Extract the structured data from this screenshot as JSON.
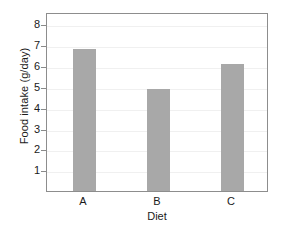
{
  "chart_data": {
    "type": "bar",
    "title": "",
    "subtitle": "",
    "xlabel": "Diet",
    "ylabel": "Food intake (g/day)",
    "categories": [
      "A",
      "B",
      "C"
    ],
    "values": [
      6.8,
      4.9,
      6.1
    ],
    "series": [
      {
        "name": "Food intake",
        "values": [
          6.8,
          4.9,
          6.1
        ]
      }
    ],
    "ylim": [
      0,
      8.6
    ],
    "yticks": [
      1,
      2,
      3,
      4,
      5,
      6,
      7,
      8
    ],
    "ytick_labels": [
      "1",
      "2",
      "3",
      "4",
      "5",
      "6",
      "7",
      "8"
    ],
    "xtick_labels": [
      "A",
      "B",
      "C"
    ],
    "grid": "horizontal",
    "legend": "none",
    "bar_color": "#a8a8a8",
    "grid_color": "#f0f0f0",
    "axis_color": "#8d8d8d",
    "background_color": "#ffffff"
  }
}
